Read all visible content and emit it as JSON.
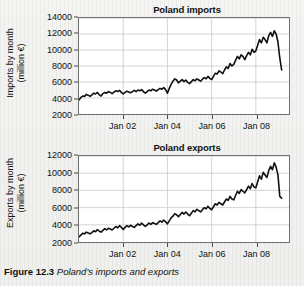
{
  "caption": {
    "label": "Figure 12.3",
    "text": "Poland's imports and exports"
  },
  "chart_data": [
    {
      "type": "line",
      "title": "Poland imports",
      "xlabel": "",
      "ylabel": "Imports by month (million €)",
      "ylabel_line1": "Imports by month",
      "ylabel_line2": "(million €)",
      "yticks": [
        2000,
        4000,
        6000,
        8000,
        10000,
        12000,
        14000
      ],
      "ytick_labels": [
        "2000",
        "4000",
        "6000",
        "8000",
        "10000",
        "12000",
        "14000"
      ],
      "ylim": [
        2000,
        14000
      ],
      "xticks": [
        2002,
        2004,
        2006,
        2008
      ],
      "xtick_labels": [
        "Jan 02",
        "Jan 04",
        "Jan 06",
        "Jan 08"
      ],
      "xlim": [
        2000.0,
        2009.5
      ],
      "grid": true,
      "legend": "none",
      "line_color": "#111111",
      "x": [
        2000.0,
        2000.083,
        2000.167,
        2000.25,
        2000.333,
        2000.417,
        2000.5,
        2000.583,
        2000.667,
        2000.75,
        2000.833,
        2000.917,
        2001.0,
        2001.083,
        2001.167,
        2001.25,
        2001.333,
        2001.417,
        2001.5,
        2001.583,
        2001.667,
        2001.75,
        2001.833,
        2001.917,
        2002.0,
        2002.083,
        2002.167,
        2002.25,
        2002.333,
        2002.417,
        2002.5,
        2002.583,
        2002.667,
        2002.75,
        2002.833,
        2002.917,
        2003.0,
        2003.083,
        2003.167,
        2003.25,
        2003.333,
        2003.417,
        2003.5,
        2003.583,
        2003.667,
        2003.75,
        2003.833,
        2003.917,
        2004.0,
        2004.083,
        2004.167,
        2004.25,
        2004.333,
        2004.417,
        2004.5,
        2004.583,
        2004.667,
        2004.75,
        2004.833,
        2004.917,
        2005.0,
        2005.083,
        2005.167,
        2005.25,
        2005.333,
        2005.417,
        2005.5,
        2005.583,
        2005.667,
        2005.75,
        2005.833,
        2005.917,
        2006.0,
        2006.083,
        2006.167,
        2006.25,
        2006.333,
        2006.417,
        2006.5,
        2006.583,
        2006.667,
        2006.75,
        2006.833,
        2006.917,
        2007.0,
        2007.083,
        2007.167,
        2007.25,
        2007.333,
        2007.417,
        2007.5,
        2007.583,
        2007.667,
        2007.75,
        2007.833,
        2007.917,
        2008.0,
        2008.083,
        2008.167,
        2008.25,
        2008.333,
        2008.417,
        2008.5,
        2008.583,
        2008.667,
        2008.75,
        2008.833,
        2008.917,
        2009.0,
        2009.083,
        2009.167
      ],
      "values": [
        3750,
        4050,
        4250,
        4200,
        4450,
        4350,
        4200,
        4400,
        4600,
        4500,
        4700,
        4400,
        4250,
        4550,
        4700,
        4600,
        4800,
        4700,
        4550,
        4750,
        4900,
        4800,
        4950,
        4700,
        4500,
        4700,
        4850,
        4750,
        4650,
        4800,
        4950,
        4800,
        5000,
        4900,
        5050,
        4800,
        4600,
        4800,
        5000,
        4900,
        5100,
        5000,
        4850,
        5050,
        5200,
        5100,
        5300,
        5050,
        4600,
        5200,
        5700,
        6100,
        6400,
        6250,
        5900,
        6100,
        6300,
        6050,
        6250,
        5950,
        5800,
        6050,
        6300,
        6150,
        6400,
        6250,
        6100,
        6350,
        6550,
        6400,
        6700,
        6450,
        6300,
        6700,
        7100,
        7000,
        7400,
        7250,
        7050,
        7500,
        7900,
        7700,
        8300,
        8000,
        8200,
        8700,
        9200,
        8900,
        9400,
        9200,
        8800,
        9300,
        9700,
        9400,
        10100,
        9700,
        9900,
        10600,
        11300,
        10900,
        11600,
        11300,
        10900,
        11800,
        12200,
        11700,
        12400,
        12000,
        11000,
        9000,
        7500
      ]
    },
    {
      "type": "line",
      "title": "Poland exports",
      "xlabel": "",
      "ylabel": "Exports by month (million €)",
      "ylabel_line1": "Exports by month",
      "ylabel_line2": "(million €)",
      "yticks": [
        2000,
        4000,
        6000,
        8000,
        10000,
        12000
      ],
      "ytick_labels": [
        "2000",
        "4000",
        "6000",
        "8000",
        "10000",
        "12000"
      ],
      "ylim": [
        2000,
        12000
      ],
      "xticks": [
        2002,
        2004,
        2006,
        2008
      ],
      "xtick_labels": [
        "Jan 02",
        "Jan 04",
        "Jan 06",
        "Jan 08"
      ],
      "xlim": [
        2000.0,
        2009.5
      ],
      "grid": true,
      "legend": "none",
      "line_color": "#111111",
      "x": [
        2000.0,
        2000.083,
        2000.167,
        2000.25,
        2000.333,
        2000.417,
        2000.5,
        2000.583,
        2000.667,
        2000.75,
        2000.833,
        2000.917,
        2001.0,
        2001.083,
        2001.167,
        2001.25,
        2001.333,
        2001.417,
        2001.5,
        2001.583,
        2001.667,
        2001.75,
        2001.833,
        2001.917,
        2002.0,
        2002.083,
        2002.167,
        2002.25,
        2002.333,
        2002.417,
        2002.5,
        2002.583,
        2002.667,
        2002.75,
        2002.833,
        2002.917,
        2003.0,
        2003.083,
        2003.167,
        2003.25,
        2003.333,
        2003.417,
        2003.5,
        2003.583,
        2003.667,
        2003.75,
        2003.833,
        2003.917,
        2004.0,
        2004.083,
        2004.167,
        2004.25,
        2004.333,
        2004.417,
        2004.5,
        2004.583,
        2004.667,
        2004.75,
        2004.833,
        2004.917,
        2005.0,
        2005.083,
        2005.167,
        2005.25,
        2005.333,
        2005.417,
        2005.5,
        2005.583,
        2005.667,
        2005.75,
        2005.833,
        2005.917,
        2006.0,
        2006.083,
        2006.167,
        2006.25,
        2006.333,
        2006.417,
        2006.5,
        2006.583,
        2006.667,
        2006.75,
        2006.833,
        2006.917,
        2007.0,
        2007.083,
        2007.167,
        2007.25,
        2007.333,
        2007.417,
        2007.5,
        2007.583,
        2007.667,
        2007.75,
        2007.833,
        2007.917,
        2008.0,
        2008.083,
        2008.167,
        2008.25,
        2008.333,
        2008.417,
        2008.5,
        2008.583,
        2008.667,
        2008.75,
        2008.833,
        2008.917,
        2009.0,
        2009.083,
        2009.167
      ],
      "values": [
        2600,
        2800,
        3000,
        2950,
        3150,
        3050,
        2950,
        3100,
        3300,
        3200,
        3450,
        3250,
        3150,
        3350,
        3550,
        3400,
        3600,
        3500,
        3400,
        3600,
        3800,
        3650,
        3900,
        3700,
        3450,
        3700,
        3900,
        3750,
        3950,
        3800,
        3700,
        3900,
        4100,
        3950,
        4200,
        4000,
        3800,
        4000,
        4200,
        4050,
        4250,
        4150,
        4050,
        4250,
        4450,
        4300,
        4550,
        4350,
        4100,
        4450,
        4800,
        5000,
        5300,
        5150,
        4950,
        5200,
        5450,
        5250,
        5500,
        5250,
        5050,
        5350,
        5650,
        5500,
        5800,
        5650,
        5500,
        5750,
        6000,
        5850,
        6150,
        5900,
        5750,
        6100,
        6450,
        6300,
        6600,
        6450,
        6300,
        6650,
        7000,
        6850,
        7300,
        7000,
        6900,
        7400,
        7900,
        7650,
        8100,
        7900,
        7700,
        8100,
        8500,
        8200,
        8800,
        8400,
        8300,
        9000,
        9700,
        9300,
        10100,
        9800,
        9500,
        10300,
        10800,
        10400,
        11200,
        10700,
        9800,
        7300,
        7100
      ]
    }
  ]
}
